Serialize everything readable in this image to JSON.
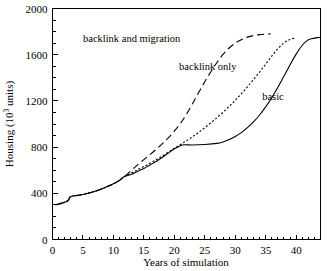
{
  "chart_data": {
    "type": "line",
    "title": "",
    "xlabel": "Years of simulation",
    "ylabel": "Housing (10³ units)",
    "ylabel_main": "Housing (10",
    "ylabel_sup": "3",
    "ylabel_tail": " units)",
    "xlim": [
      0,
      44
    ],
    "ylim": [
      0,
      2000
    ],
    "xticks": [
      0,
      5,
      10,
      15,
      20,
      25,
      30,
      35,
      40
    ],
    "xtick_labels": [
      "0",
      "5",
      "10",
      "15",
      "20",
      "25",
      "30",
      "35",
      "40"
    ],
    "xtick_minor_step": 1,
    "yticks": [
      0,
      400,
      800,
      1200,
      1600,
      2000
    ],
    "ytick_labels": [
      "0",
      "400",
      "800",
      "1200",
      "1600",
      "2000"
    ],
    "ytick_minor_step": 100,
    "grid": false,
    "legend_position": "inline-annotations",
    "series": [
      {
        "name": "basic",
        "label": "basic",
        "style": "solid",
        "label_x": 36.2,
        "label_y": 1245,
        "points": [
          [
            0.5,
            300
          ],
          [
            1.0,
            305
          ],
          [
            1.5,
            312
          ],
          [
            2.0,
            322
          ],
          [
            2.5,
            335
          ],
          [
            3.0,
            372
          ],
          [
            4.0,
            380
          ],
          [
            5.0,
            390
          ],
          [
            6.0,
            403
          ],
          [
            7.0,
            418
          ],
          [
            8.0,
            436
          ],
          [
            9.0,
            458
          ],
          [
            10.0,
            482
          ],
          [
            11.0,
            512
          ],
          [
            11.8,
            545
          ],
          [
            13.0,
            565
          ],
          [
            14.0,
            590
          ],
          [
            15.0,
            615
          ],
          [
            16.0,
            645
          ],
          [
            17.0,
            675
          ],
          [
            18.0,
            710
          ],
          [
            19.0,
            748
          ],
          [
            20.0,
            785
          ],
          [
            21.0,
            812
          ],
          [
            21.6,
            820
          ],
          [
            23.0,
            818
          ],
          [
            25.0,
            822
          ],
          [
            27.0,
            832
          ],
          [
            28.0,
            845
          ],
          [
            29.0,
            865
          ],
          [
            30.0,
            892
          ],
          [
            31.0,
            925
          ],
          [
            32.0,
            968
          ],
          [
            33.0,
            1018
          ],
          [
            34.0,
            1078
          ],
          [
            35.0,
            1148
          ],
          [
            36.0,
            1228
          ],
          [
            37.0,
            1318
          ],
          [
            38.0,
            1415
          ],
          [
            39.0,
            1512
          ],
          [
            40.0,
            1605
          ],
          [
            41.0,
            1682
          ],
          [
            41.8,
            1722
          ],
          [
            42.5,
            1738
          ],
          [
            43.5,
            1748
          ],
          [
            44.0,
            1752
          ]
        ]
      },
      {
        "name": "backlink only",
        "label": "backlink only",
        "style": "dotted",
        "label_x": 25.5,
        "label_y": 1500,
        "points": [
          [
            0.5,
            300
          ],
          [
            2.5,
            335
          ],
          [
            3.0,
            372
          ],
          [
            5.0,
            390
          ],
          [
            7.0,
            418
          ],
          [
            9.0,
            458
          ],
          [
            10.0,
            482
          ],
          [
            11.0,
            512
          ],
          [
            11.8,
            545
          ],
          [
            13.0,
            578
          ],
          [
            14.0,
            605
          ],
          [
            15.0,
            632
          ],
          [
            16.0,
            660
          ],
          [
            17.0,
            690
          ],
          [
            18.0,
            722
          ],
          [
            19.0,
            755
          ],
          [
            20.0,
            790
          ],
          [
            21.0,
            822
          ],
          [
            22.0,
            855
          ],
          [
            23.0,
            890
          ],
          [
            24.0,
            928
          ],
          [
            25.0,
            968
          ],
          [
            26.0,
            1010
          ],
          [
            27.0,
            1055
          ],
          [
            28.0,
            1102
          ],
          [
            29.0,
            1152
          ],
          [
            30.0,
            1205
          ],
          [
            31.0,
            1262
          ],
          [
            32.0,
            1322
          ],
          [
            33.0,
            1385
          ],
          [
            34.0,
            1450
          ],
          [
            35.0,
            1518
          ],
          [
            36.0,
            1588
          ],
          [
            37.0,
            1652
          ],
          [
            38.0,
            1702
          ],
          [
            39.0,
            1732
          ],
          [
            40.0,
            1745
          ]
        ]
      },
      {
        "name": "backlink and migration",
        "label": "backlink and migration",
        "style": "dashed",
        "label_x": 13.0,
        "label_y": 1742,
        "points": [
          [
            0.5,
            300
          ],
          [
            2.5,
            335
          ],
          [
            3.0,
            372
          ],
          [
            5.0,
            390
          ],
          [
            7.0,
            418
          ],
          [
            9.0,
            458
          ],
          [
            10.0,
            482
          ],
          [
            11.0,
            512
          ],
          [
            11.8,
            545
          ],
          [
            13.0,
            600
          ],
          [
            14.0,
            648
          ],
          [
            15.0,
            692
          ],
          [
            16.0,
            735
          ],
          [
            17.0,
            780
          ],
          [
            18.0,
            828
          ],
          [
            19.0,
            880
          ],
          [
            20.0,
            938
          ],
          [
            21.0,
            1005
          ],
          [
            22.0,
            1085
          ],
          [
            23.0,
            1178
          ],
          [
            24.0,
            1272
          ],
          [
            25.0,
            1365
          ],
          [
            26.0,
            1452
          ],
          [
            27.0,
            1532
          ],
          [
            28.0,
            1602
          ],
          [
            29.0,
            1658
          ],
          [
            30.0,
            1700
          ],
          [
            31.0,
            1730
          ],
          [
            32.0,
            1752
          ],
          [
            33.0,
            1766
          ],
          [
            34.0,
            1774
          ],
          [
            35.0,
            1778
          ],
          [
            35.8,
            1780
          ]
        ]
      }
    ]
  }
}
